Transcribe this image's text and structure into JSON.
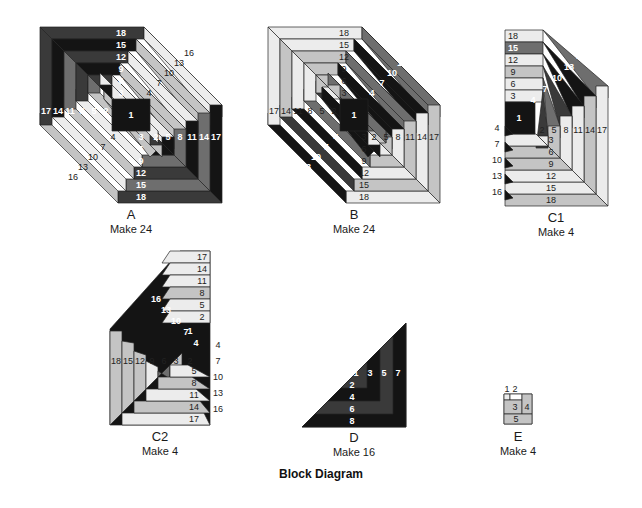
{
  "title": "Block Diagram",
  "colors": {
    "black": "#141414",
    "dark": "#3a3a3a",
    "mid": "#6e6e6e",
    "light": "#c4c4c4",
    "pale": "#ececec",
    "stroke": "#222222"
  },
  "blocks": [
    {
      "id": "A",
      "letter": "A",
      "make": "Make 24",
      "x": 40,
      "y": 27,
      "w": 182,
      "h": 176,
      "cut": 58,
      "labels_left": [
        "17",
        "14",
        "11",
        "8",
        "5",
        "2"
      ],
      "labels_right": [
        "2",
        "5",
        "8",
        "11",
        "14",
        "17"
      ],
      "labels_top": [
        "18",
        "15",
        "12",
        "9",
        "6",
        "3"
      ],
      "labels_bottom": [
        "3",
        "6",
        "9",
        "12",
        "15",
        "18"
      ],
      "labels_diag_upper": [
        "4",
        "7",
        "10",
        "13",
        "16"
      ],
      "labels_diag_lower": [
        "4",
        "7",
        "10",
        "13",
        "16"
      ],
      "center": "1"
    },
    {
      "id": "B",
      "letter": "B",
      "make": "Make 24",
      "x": 268,
      "y": 27,
      "w": 172,
      "h": 176,
      "cut": 58,
      "labels_left": [
        "17",
        "14",
        "11",
        "8",
        "5",
        "2"
      ],
      "labels_right": [
        "2",
        "5",
        "8",
        "11",
        "14",
        "17"
      ],
      "labels_top": [
        "18",
        "15",
        "12",
        "9",
        "6",
        "3"
      ],
      "labels_bottom": [
        "3",
        "6",
        "9",
        "12",
        "15",
        "18"
      ],
      "labels_diag_upper": [
        "4",
        "7",
        "10",
        "13",
        "16"
      ],
      "labels_diag_lower": [
        "4",
        "7",
        "10",
        "13",
        "16"
      ],
      "center": "1"
    },
    {
      "id": "C1",
      "letter": "C1",
      "make": "Make 4",
      "x": 505,
      "y": 30,
      "w": 103,
      "h": 176,
      "labels_top": [
        "18",
        "15",
        "12",
        "9",
        "6",
        "3"
      ],
      "labels_right": [
        "2",
        "5",
        "8",
        "11",
        "14",
        "17"
      ],
      "labels_bottom": [
        "3",
        "6",
        "9",
        "12",
        "15",
        "18"
      ],
      "labels_outside_left": [
        "4",
        "7",
        "10",
        "13",
        "16"
      ],
      "labels_diag_upper": [
        "4",
        "7",
        "10",
        "13",
        "16"
      ],
      "center": "1"
    },
    {
      "id": "C2",
      "letter": "C2",
      "make": "Make 4",
      "x": 110,
      "y": 249,
      "w": 100,
      "h": 176,
      "labels_left": [
        "18",
        "15",
        "12",
        "9",
        "6",
        "3",
        "2"
      ],
      "labels_bottom": [
        "5",
        "8",
        "11",
        "14",
        "17"
      ],
      "labels_right_inner": [
        "17",
        "14",
        "11",
        "8",
        "5",
        "2"
      ],
      "labels_outside_right": [
        "4",
        "7",
        "10",
        "13",
        "16"
      ],
      "labels_diag_upper": [
        "16",
        "13",
        "10",
        "7",
        "4"
      ],
      "center": "1"
    },
    {
      "id": "D",
      "letter": "D",
      "make": "Make 16",
      "x": 302,
      "y": 323,
      "w": 104,
      "h": 104,
      "labels_vertical": [
        "1",
        "3",
        "5",
        "7"
      ],
      "labels_horizontal": [
        "2",
        "4",
        "6",
        "8"
      ]
    },
    {
      "id": "E",
      "letter": "E",
      "make": "Make 4",
      "x": 504,
      "y": 394,
      "w": 28,
      "h": 30,
      "labels": [
        "1",
        "2",
        "3",
        "4",
        "5"
      ]
    }
  ]
}
